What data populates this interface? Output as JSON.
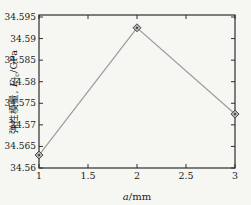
{
  "figure": {
    "background": "#f6f6f3",
    "axis_color": "#2e2e2e",
    "line_color": "#9b9b9b",
    "marker_fill": "#b2b2b2",
    "marker_stroke": "#4a4a4a",
    "marker_dot": "#3a3a3a",
    "text_color": "#1c1c1c"
  },
  "chart_data": {
    "type": "line",
    "x": [
      1,
      2,
      3
    ],
    "values": [
      34.563,
      34.5925,
      34.5725
    ],
    "title": "",
    "xlabel_var": "a",
    "xlabel_unit": "/mm",
    "ylabel_cjk": "弹性模量,",
    "ylabel_var": "E",
    "ylabel_sub": "fc",
    "ylabel_unit": "/GPa",
    "xlim": [
      1,
      3
    ],
    "ylim": [
      34.56,
      34.595
    ],
    "xticks": [
      1,
      1.5,
      2,
      2.5,
      3
    ],
    "yticks": [
      34.56,
      34.565,
      34.57,
      34.575,
      34.58,
      34.585,
      34.59,
      34.595
    ],
    "marker": "diamond",
    "grid": false,
    "legend": "none"
  }
}
